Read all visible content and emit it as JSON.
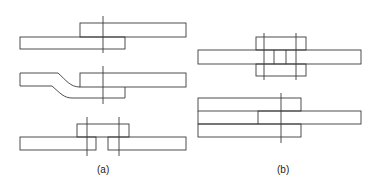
{
  "figure": {
    "type": "technical-drawing",
    "stroke_color": "#3a3a3a",
    "background": "#ffffff"
  },
  "labels": {
    "a": "(a)",
    "b": "(b)"
  },
  "panels": [
    {
      "id": "a",
      "drawings": [
        {
          "name": "lap-joint",
          "description": "two plates overlapping with one center line"
        },
        {
          "name": "joggled-lap-joint",
          "description": "one plate joggled (offset bend) overlapping the other"
        },
        {
          "name": "single-strap-butt-joint",
          "description": "two plates butted with a cover strap and two center lines"
        }
      ]
    },
    {
      "id": "b",
      "drawings": [
        {
          "name": "double-strap-butt-joint",
          "description": "two plates butted with cover straps top and bottom, two center lines"
        },
        {
          "name": "double-lap-joint",
          "description": "one plate sandwiched between two plates, one center line"
        }
      ]
    }
  ]
}
